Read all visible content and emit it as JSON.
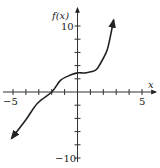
{
  "chart_data": {
    "type": "line",
    "title": "",
    "xlabel": "x",
    "ylabel": "f(x)",
    "xlim": [
      -5,
      5
    ],
    "ylim": [
      -10,
      10
    ],
    "x_tick_step": 1,
    "y_tick_step": 2,
    "x_tick_labels": [
      "-5",
      "5"
    ],
    "y_tick_labels": [
      "10",
      "-10"
    ],
    "grid": false,
    "arrows_on_ends": true,
    "series": [
      {
        "name": "f(x)",
        "x": [
          -5.1,
          -4.0,
          -3.1,
          -2.0,
          -1.3,
          -0.5,
          0.0,
          0.6,
          1.4,
          1.8,
          2.2,
          2.4,
          2.8
        ],
        "y": [
          -7.0,
          -4.2,
          -1.7,
          0.0,
          1.8,
          2.6,
          2.9,
          2.9,
          3.3,
          4.4,
          5.9,
          7.1,
          10.9
        ]
      }
    ]
  },
  "labels": {
    "y_axis": "f(x)",
    "x_axis": "x",
    "y_top": "10",
    "y_bottom": "−10",
    "x_left": "−5",
    "x_right": "5"
  }
}
